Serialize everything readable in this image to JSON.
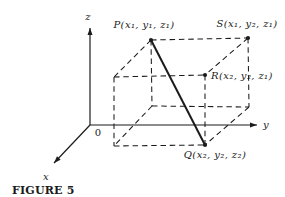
{
  "figure": {
    "caption": "FIGURE 5",
    "colors": {
      "ink": "#1b1b1b",
      "paper": "#ffffff"
    },
    "canvas": {
      "width": 285,
      "height": 197
    },
    "axes": [
      {
        "id": "z-axis",
        "label": "z",
        "from": [
          90,
          125
        ],
        "to": [
          90,
          28
        ],
        "label_x": 88,
        "label_y": 20,
        "anchor": "middle"
      },
      {
        "id": "y-axis",
        "label": "y",
        "from": [
          90,
          125
        ],
        "to": [
          257,
          125
        ],
        "label_x": 263,
        "label_y": 128,
        "anchor": "start"
      },
      {
        "id": "x-axis",
        "label": "x",
        "from": [
          90,
          125
        ],
        "to": [
          54,
          163
        ],
        "label_x": 46,
        "label_y": 180,
        "anchor": "middle"
      }
    ],
    "origin": {
      "label": "0",
      "x": 98,
      "y": 136
    },
    "box": {
      "vertices": {
        "P": [
          151,
          40
        ],
        "S": [
          248,
          38
        ],
        "R": [
          205,
          75
        ],
        "Q": [
          205,
          145
        ],
        "TL": [
          114,
          77
        ],
        "FL": [
          152,
          106
        ],
        "FR": [
          249,
          107
        ],
        "BL": [
          114,
          146
        ]
      },
      "dashed_edges": [
        [
          "P",
          "S"
        ],
        [
          "P",
          "TL"
        ],
        [
          "S",
          "R"
        ],
        [
          "TL",
          "R"
        ],
        [
          "P",
          "FL"
        ],
        [
          "S",
          "FR"
        ],
        [
          "R",
          "Q"
        ],
        [
          "TL",
          "BL"
        ],
        [
          "FL",
          "FR"
        ],
        [
          "FL",
          "BL"
        ],
        [
          "FR",
          "Q"
        ],
        [
          "BL",
          "Q"
        ]
      ],
      "diagonal": [
        "P",
        "Q"
      ],
      "marked_points": [
        "P",
        "S",
        "R",
        "Q"
      ],
      "dot_radius": 2.1
    },
    "labels": [
      {
        "id": "P",
        "text": "P(x₁, y₁, z₁)",
        "x": 144,
        "y": 28,
        "anchor": "middle"
      },
      {
        "id": "S",
        "text": "S(x₁, y₂, z₁)",
        "x": 247,
        "y": 27,
        "anchor": "middle"
      },
      {
        "id": "R",
        "text": "R(x₂, y₂, z₁)",
        "x": 211,
        "y": 79,
        "anchor": "start"
      },
      {
        "id": "Q",
        "text": "Q(x₂, y₂, z₂)",
        "x": 215,
        "y": 158,
        "anchor": "middle"
      }
    ]
  }
}
